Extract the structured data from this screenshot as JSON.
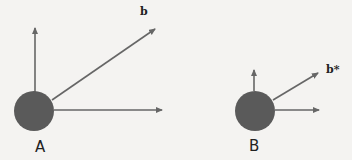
{
  "diagram": {
    "colors": {
      "background": "#f4f3f1",
      "circle": "#5a5a5a",
      "arrow": "#666666",
      "text": "#222222"
    },
    "panels": [
      {
        "id": "A",
        "label": "A",
        "vector_label": "b",
        "circle": {
          "cx": 34,
          "cy": 111,
          "r": 20
        },
        "arrows": [
          {
            "name": "vertical",
            "x1": 35,
            "y1": 92,
            "x2": 35,
            "y2": 28
          },
          {
            "name": "diagonal",
            "x1": 52,
            "y1": 100,
            "x2": 155,
            "y2": 29
          },
          {
            "name": "horizontal",
            "x1": 54,
            "y1": 110,
            "x2": 162,
            "y2": 110
          }
        ]
      },
      {
        "id": "B",
        "label": "B",
        "vector_label": "b*",
        "circle": {
          "cx": 255,
          "cy": 111,
          "r": 20
        },
        "arrows": [
          {
            "name": "vertical",
            "x1": 254,
            "y1": 91,
            "x2": 254,
            "y2": 70
          },
          {
            "name": "diagonal",
            "x1": 273,
            "y1": 100,
            "x2": 318,
            "y2": 73
          },
          {
            "name": "horizontal",
            "x1": 275,
            "y1": 110,
            "x2": 319,
            "y2": 110
          }
        ]
      }
    ]
  }
}
